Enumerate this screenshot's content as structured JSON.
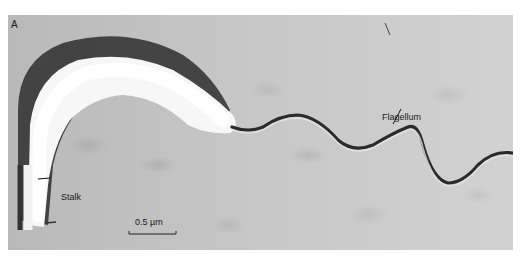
{
  "figure": {
    "panel_letter": "A",
    "labels": {
      "stalk": "Stalk",
      "flagellum": "Flagellum"
    },
    "scale_bar": {
      "label": "0.5 µm"
    }
  }
}
